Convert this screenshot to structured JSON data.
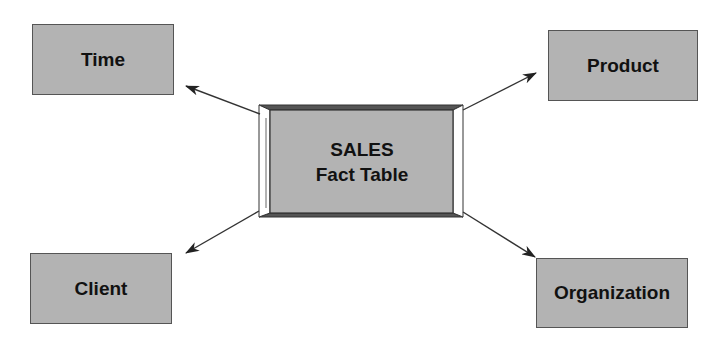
{
  "diagram": {
    "type": "star-schema",
    "fact_table": {
      "line1": "SALES",
      "line2": "Fact Table"
    },
    "dimensions": [
      {
        "id": "time",
        "label": "Time"
      },
      {
        "id": "product",
        "label": "Product"
      },
      {
        "id": "client",
        "label": "Client"
      },
      {
        "id": "organization",
        "label": "Organization"
      }
    ],
    "edges": [
      {
        "from": "SALES Fact Table",
        "to": "Time"
      },
      {
        "from": "SALES Fact Table",
        "to": "Product"
      },
      {
        "from": "SALES Fact Table",
        "to": "Client"
      },
      {
        "from": "SALES Fact Table",
        "to": "Organization"
      }
    ],
    "colors": {
      "box_fill": "#b3b3b3",
      "border": "#555555",
      "text": "#111111",
      "arrow": "#333333"
    }
  }
}
